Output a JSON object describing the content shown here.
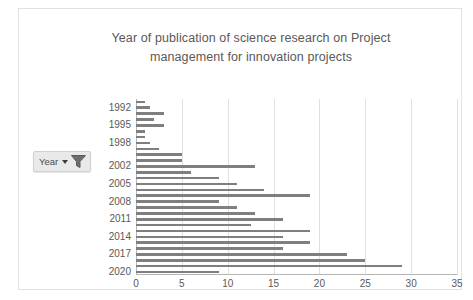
{
  "chart_data": {
    "type": "bar",
    "orientation": "horizontal",
    "title": "Year of publication of science research on Project management for innovation projects",
    "title_line1": "Year of publication of science research on Project",
    "title_line2": "management for innovation projects",
    "xlabel": "",
    "ylabel": "Year",
    "xlim": [
      0,
      35
    ],
    "xticks": [
      0,
      5,
      10,
      15,
      20,
      25,
      30,
      35
    ],
    "grid": true,
    "legend": false,
    "bar_color": "#7f7f7f",
    "categories": [
      "1991",
      "1992",
      "1993",
      "1994",
      "1995",
      "1996",
      "1997",
      "1998",
      "1999",
      "2000",
      "2001",
      "2002",
      "2003",
      "2004",
      "2005",
      "2006",
      "2007",
      "2008",
      "2009",
      "2010",
      "2011",
      "2012",
      "2013",
      "2014",
      "2015",
      "2016",
      "2017",
      "2018",
      "2019",
      "2020"
    ],
    "visible_category_labels": [
      "1992",
      "1995",
      "1998",
      "2002",
      "2005",
      "2008",
      "2011",
      "2014",
      "2017",
      "2020"
    ],
    "values": [
      1,
      1.5,
      3,
      2,
      3,
      1,
      1,
      1.5,
      2.5,
      5,
      5,
      13,
      6,
      9,
      11,
      14,
      19,
      9,
      11,
      13,
      16,
      12.5,
      19,
      16,
      19,
      16,
      23,
      25,
      29,
      9
    ]
  },
  "slicer": {
    "label": "Year",
    "caret_icon": "chevron-down-icon",
    "filter_icon": "funnel-filter-icon"
  },
  "colors": {
    "bar": "#7f7f7f",
    "text": "#595959",
    "gridline": "#e0e0e0",
    "axis": "#b6b6b6",
    "frame_border": "#e2e2e2"
  }
}
